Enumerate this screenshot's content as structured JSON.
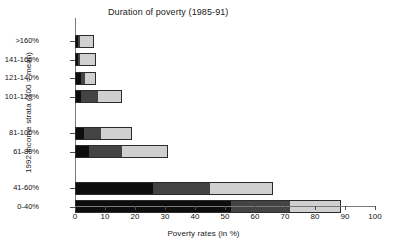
{
  "chart_data": {
    "type": "bar",
    "orientation": "horizontal",
    "stacked": true,
    "title": "Duration of poverty (1985-91)",
    "xlabel": "Poverty rates (in %)",
    "ylabel": "1992 income strata (100 = mean)",
    "xlim": [
      0,
      100
    ],
    "xticks": [
      0,
      10,
      20,
      30,
      40,
      50,
      60,
      70,
      80,
      90,
      100
    ],
    "xtick_labels": [
      "0",
      "10",
      "20",
      "30",
      "40",
      "50",
      "60",
      "70",
      "80",
      "90",
      "100"
    ],
    "grid": false,
    "legend": null,
    "categories": [
      ">160%",
      "141-160%",
      "121-140%",
      "101-120%",
      "81-100%",
      "61-80%",
      "41-60%",
      "0-40%"
    ],
    "series": [
      {
        "name": "long duration",
        "color": "#0d0d0d",
        "values": [
          1.0,
          1.0,
          2.0,
          2.0,
          3.0,
          4.5,
          26.0,
          52.0
        ]
      },
      {
        "name": "medium duration",
        "color": "#444444",
        "values": [
          0.7,
          0.8,
          1.2,
          5.5,
          5.5,
          11.0,
          19.0,
          19.5
        ]
      },
      {
        "name": "short duration",
        "color": "#d0d0d0",
        "values": [
          4.8,
          5.2,
          3.8,
          8.0,
          10.5,
          15.5,
          21.0,
          17.0
        ]
      }
    ],
    "totals": [
      6.5,
      7.0,
      7.0,
      15.5,
      19.0,
      31.0,
      66.0,
      88.5
    ],
    "group_gaps_after": [
      "101-120%",
      "61-80%"
    ]
  }
}
